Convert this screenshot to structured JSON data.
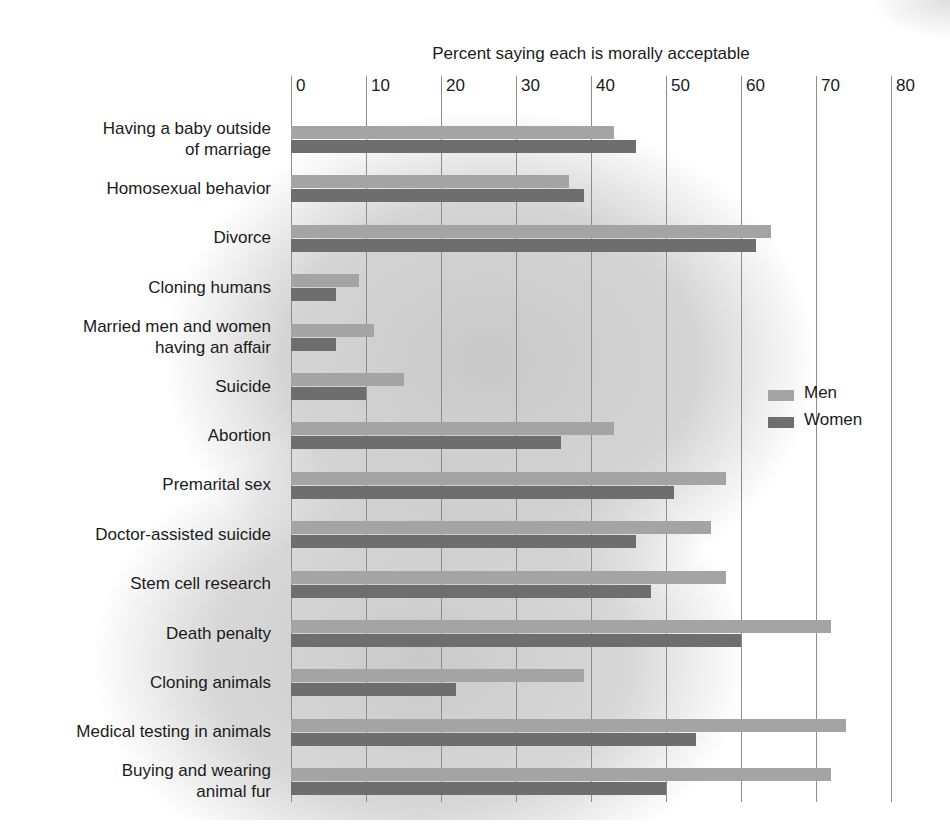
{
  "chart_data": {
    "type": "bar",
    "orientation": "horizontal",
    "title": "Percent saying each is morally acceptable",
    "xlabel": "",
    "ylabel": "",
    "xlim": [
      0,
      80
    ],
    "xticks": [
      0,
      10,
      20,
      30,
      40,
      50,
      60,
      70,
      80
    ],
    "grid": true,
    "legend_position": "center-right",
    "categories": [
      "Having a baby outside\nof marriage",
      "Homosexual behavior",
      "Divorce",
      "Cloning humans",
      "Married men and women\nhaving an affair",
      "Suicide",
      "Abortion",
      "Premarital sex",
      "Doctor-assisted suicide",
      "Stem cell research",
      "Death penalty",
      "Cloning animals",
      "Medical testing in animals",
      "Buying and wearing\nanimal fur"
    ],
    "series": [
      {
        "name": "Men",
        "color": "#a4a4a4",
        "values": [
          43,
          37,
          64,
          9,
          11,
          15,
          43,
          58,
          56,
          58,
          72,
          39,
          74,
          72
        ]
      },
      {
        "name": "Women",
        "color": "#6e6e6e",
        "values": [
          46,
          39,
          62,
          6,
          6,
          10,
          36,
          51,
          46,
          48,
          60,
          22,
          54,
          50
        ]
      }
    ]
  },
  "legend": {
    "items": [
      {
        "label": "Men"
      },
      {
        "label": "Women"
      }
    ]
  },
  "colors": {
    "men_bar": "#a4a4a4",
    "women_bar": "#6e6e6e",
    "gridline": "#8d8d8d",
    "text": "#1b1b1b",
    "background": "#ffffff"
  }
}
